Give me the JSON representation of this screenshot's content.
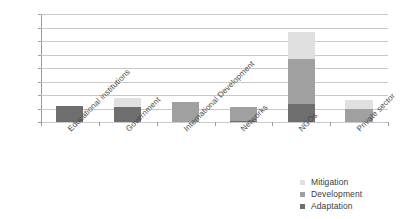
{
  "chart_data": {
    "type": "bar",
    "subtype": "stacked-bar",
    "title": "",
    "subtitle": "",
    "xlabel": "",
    "ylabel": "",
    "ylim": [
      0,
      40
    ],
    "ytick_step": 5,
    "yticks": [
      "0",
      "5",
      "10",
      "15",
      "20",
      "25",
      "30",
      "35",
      "40"
    ],
    "grid": "horizontal",
    "legend_position": "bottom-right",
    "categories": [
      "Educational institutions",
      "Government",
      "International Development",
      "Networks",
      "NGOs",
      "Private sector"
    ],
    "series": [
      {
        "name": "Adaptation",
        "color": "#6e6e6e",
        "values": [
          6,
          5.5,
          0,
          0.5,
          6.5,
          0
        ]
      },
      {
        "name": "Development",
        "color": "#a0a0a0",
        "values": [
          0,
          0,
          7.5,
          5,
          17,
          5
        ]
      },
      {
        "name": "Mitigation",
        "color": "#e0e0e0",
        "values": [
          0,
          3.5,
          0,
          0,
          10,
          3
        ]
      }
    ],
    "stack_order_bottom_to_top": [
      "Adaptation",
      "Development",
      "Mitigation"
    ],
    "totals": [
      6,
      9,
      7.5,
      5.5,
      33.5,
      8
    ],
    "annotations": []
  },
  "legend": {
    "items": [
      {
        "label": "Mitigation",
        "color": "#e0e0e0"
      },
      {
        "label": "Development",
        "color": "#a0a0a0"
      },
      {
        "label": "Adaptation",
        "color": "#6e6e6e"
      }
    ]
  },
  "axes": {
    "y_tick_labels": [
      "40",
      "35",
      "30",
      "25",
      "20",
      "15",
      "10",
      "5",
      "0"
    ],
    "x_tick_labels": [
      "Educational institutions",
      "Government",
      "International Development",
      "Networks",
      "NGOs",
      "Private sector"
    ]
  },
  "colors": {
    "mitigation": "#e0e0e0",
    "development": "#a0a0a0",
    "adaptation": "#6e6e6e",
    "gridline": "#c9c9c9",
    "axis": "#9a9a9a",
    "text": "#3b3b3b",
    "background": "#ffffff"
  }
}
